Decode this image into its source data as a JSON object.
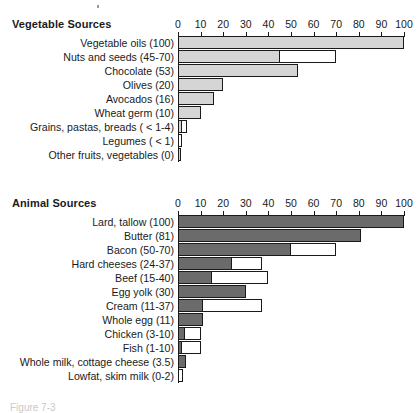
{
  "figure": {
    "caption_fragment": "Figure 7-3",
    "axis_min": 0,
    "axis_max": 100,
    "tick_step": 10,
    "colors": {
      "vegetable_bar": "#d5d5d5",
      "animal_bar": "#6b6b6b",
      "range_bar": "#ffffff",
      "outline": "#1a1a1a"
    }
  },
  "chart_data": [
    {
      "type": "bar",
      "title": "Vegetable Sources",
      "orientation": "horizontal",
      "xlabel": "",
      "ylabel": "",
      "xlim": [
        0,
        100
      ],
      "ticks": [
        0,
        10,
        20,
        30,
        40,
        50,
        60,
        70,
        80,
        90,
        100
      ],
      "grid": false,
      "legend": "none",
      "categories": [
        "Vegetable oils (100)",
        "Nuts and seeds (45-70)",
        "Chocolate (53)",
        "Olives (20)",
        "Avocados (16)",
        "Wheat germ (10)",
        "Grains, pastas, breads ( < 1-4)",
        "Legumes ( < 1)",
        "Other fruits, vegetables (0)"
      ],
      "values": [
        {
          "label": "Vegetable oils (100)",
          "low": 100,
          "high": 100
        },
        {
          "label": "Nuts and seeds (45-70)",
          "low": 45,
          "high": 70
        },
        {
          "label": "Chocolate (53)",
          "low": 53,
          "high": 53
        },
        {
          "label": "Olives (20)",
          "low": 20,
          "high": 20
        },
        {
          "label": "Avocados (16)",
          "low": 16,
          "high": 16
        },
        {
          "label": "Wheat germ (10)",
          "low": 10,
          "high": 10
        },
        {
          "label": "Grains, pastas, breads ( < 1-4)",
          "low": 1,
          "high": 4
        },
        {
          "label": "Legumes ( < 1)",
          "low": 0,
          "high": 1
        },
        {
          "label": "Other fruits, vegetables (0)",
          "low": 0,
          "high": 0
        }
      ]
    },
    {
      "type": "bar",
      "title": "Animal Sources",
      "orientation": "horizontal",
      "xlabel": "",
      "ylabel": "",
      "xlim": [
        0,
        100
      ],
      "ticks": [
        0,
        10,
        20,
        30,
        40,
        50,
        60,
        70,
        80,
        90,
        100
      ],
      "grid": false,
      "legend": "none",
      "categories": [
        "Lard, tallow (100)",
        "Butter (81)",
        "Bacon (50-70)",
        "Hard cheeses (24-37)",
        "Beef (15-40)",
        "Egg yolk (30)",
        "Cream (11-37)",
        "Whole egg (11)",
        "Chicken (3-10)",
        "Fish (1-10)",
        "Whole milk, cottage cheese (3.5)",
        "Lowfat, skim milk (0-2)"
      ],
      "values": [
        {
          "label": "Lard, tallow (100)",
          "low": 100,
          "high": 100
        },
        {
          "label": "Butter (81)",
          "low": 81,
          "high": 81
        },
        {
          "label": "Bacon (50-70)",
          "low": 50,
          "high": 70
        },
        {
          "label": "Hard cheeses (24-37)",
          "low": 24,
          "high": 37
        },
        {
          "label": "Beef (15-40)",
          "low": 15,
          "high": 40
        },
        {
          "label": "Egg yolk (30)",
          "low": 30,
          "high": 30
        },
        {
          "label": "Cream (11-37)",
          "low": 11,
          "high": 37
        },
        {
          "label": "Whole egg (11)",
          "low": 11,
          "high": 11
        },
        {
          "label": "Chicken (3-10)",
          "low": 3,
          "high": 10
        },
        {
          "label": "Fish (1-10)",
          "low": 1,
          "high": 10
        },
        {
          "label": "Whole milk, cottage cheese (3.5)",
          "low": 3.5,
          "high": 3.5
        },
        {
          "label": "Lowfat, skim milk (0-2)",
          "low": 0,
          "high": 2
        }
      ]
    }
  ]
}
